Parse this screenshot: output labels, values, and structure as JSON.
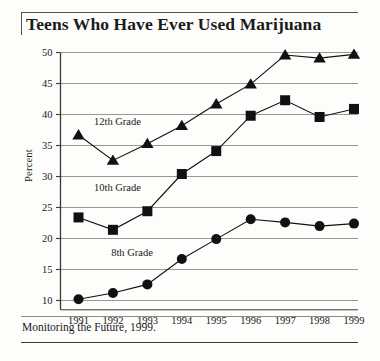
{
  "chart_data": {
    "type": "line",
    "title": "Teens Who Have Ever Used Marijuana",
    "xlabel": "",
    "ylabel": "Percent",
    "x": [
      "1991",
      "1992",
      "1993",
      "1994",
      "1995",
      "1996",
      "1997",
      "1998",
      "1999"
    ],
    "categories": [
      "1991",
      "1992",
      "1993",
      "1994",
      "1995",
      "1996",
      "1997",
      "1998",
      "1999"
    ],
    "xticklabels": [
      "1991",
      "1992",
      "1993",
      "1994",
      "1995",
      "1996",
      "1997",
      "1998",
      "1999"
    ],
    "yticklabels": [
      "10",
      "15",
      "20",
      "25",
      "30",
      "35",
      "40",
      "45",
      "50"
    ],
    "yticks": [
      10,
      15,
      20,
      25,
      30,
      35,
      40,
      45,
      50
    ],
    "ylim": [
      8.5,
      50
    ],
    "grid": "horizontal",
    "legend": "inline-labels",
    "series": [
      {
        "name": "12th Grade",
        "marker": "triangle",
        "color": "#111111",
        "values": [
          36.7,
          32.6,
          35.3,
          38.2,
          41.7,
          44.9,
          49.6,
          49.1,
          49.7
        ]
      },
      {
        "name": "10th Grade",
        "marker": "square",
        "color": "#111111",
        "values": [
          23.4,
          21.4,
          24.4,
          30.4,
          34.1,
          39.8,
          42.3,
          39.6,
          40.9
        ]
      },
      {
        "name": "8th Grade",
        "marker": "circle",
        "color": "#111111",
        "values": [
          10.2,
          11.2,
          12.6,
          16.7,
          19.9,
          23.1,
          22.6,
          22.0,
          22.4
        ]
      }
    ],
    "annotations": [
      {
        "text": "12th Grade",
        "x": 1991.45,
        "y": 38.3
      },
      {
        "text": "10th Grade",
        "x": 1991.45,
        "y": 27.6
      },
      {
        "text": "8th Grade",
        "x": 1991.95,
        "y": 17.2
      }
    ]
  },
  "footer": {
    "source": "Monitoring the Future, 1999."
  },
  "colors": {
    "ink": "#111111",
    "grid": "#8d8b85",
    "axis": "#3a3935",
    "paper": "#fdfdfb"
  }
}
